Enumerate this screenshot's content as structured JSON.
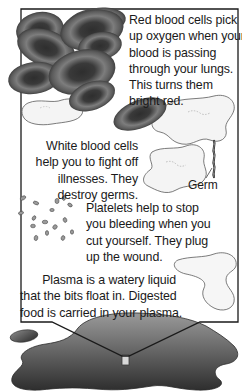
{
  "diagram": {
    "colors": {
      "frame": "#1a1a1a",
      "red_cell_dark": "#2a2a2a",
      "red_cell_mid": "#6e6e6e",
      "red_cell_light": "#9a9a9a",
      "white_cell_fill": "#f4f4f4",
      "white_cell_edge": "#5a5a5a",
      "platelet": "#8a8a8a",
      "puddle_dark": "#3a3a3a",
      "puddle_light": "#8c8c8c",
      "text": "#1a1a1a"
    },
    "sections": [
      {
        "id": "red-blood-cells",
        "lines": [
          "Red blood cells pick",
          "up oxygen when your",
          "blood is passing",
          "through your lungs.",
          "This turns them",
          "bright red."
        ]
      },
      {
        "id": "white-blood-cells",
        "lines": [
          "White blood cells",
          "help you to fight off",
          "illnesses. They",
          "destroy germs."
        ]
      },
      {
        "id": "platelets",
        "lines": [
          "Platelets help to stop",
          "you bleeding when you",
          "cut yourself. They plug",
          "up the wound."
        ]
      },
      {
        "id": "plasma",
        "lines": [
          "Plasma is a watery liquid",
          "that the bits float in. Digested",
          "food is carried in your plasma."
        ]
      }
    ],
    "callouts": {
      "germ": "Germ"
    }
  }
}
